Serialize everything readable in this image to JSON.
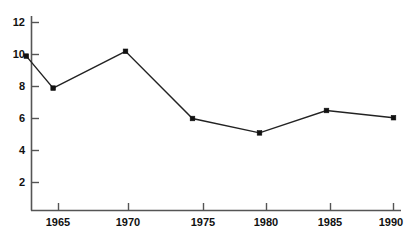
{
  "chart_data": {
    "type": "line",
    "title": "",
    "subtitle": "",
    "xlabel": "",
    "ylabel": "",
    "grid": false,
    "legend": false,
    "legend_position": "none",
    "xlim": [
      1962.5,
      1990.5
    ],
    "ylim": [
      0,
      12
    ],
    "xticks": [
      1965,
      1970,
      1975,
      1980,
      1985,
      1990
    ],
    "xtick_labels": [
      "1965",
      "1970",
      "1975",
      "1980",
      "1985",
      "1990"
    ],
    "yticks": [
      2,
      4,
      6,
      8,
      10,
      12
    ],
    "ytick_labels": [
      "2",
      "4",
      "6",
      "8",
      "10",
      "12"
    ],
    "x": [
      1962.6,
      1964.6,
      1970.0,
      1975.0,
      1980.0,
      1985.0,
      1990.0
    ],
    "values": [
      9.9,
      7.9,
      10.2,
      6.0,
      5.1,
      6.5,
      6.05
    ],
    "series": [
      {
        "name": "",
        "x": [
          1962.6,
          1964.6,
          1970.0,
          1975.0,
          1980.0,
          1985.0,
          1990.0
        ],
        "values": [
          9.9,
          7.9,
          10.2,
          6.0,
          5.1,
          6.5,
          6.05
        ],
        "color": "#222222",
        "marker": "square"
      }
    ],
    "colors": {
      "line": "#222222",
      "marker": "#111111",
      "axis": "#555555",
      "text": "#111111",
      "background": "#ffffff"
    }
  },
  "axes": {
    "y_tick_labels": [
      "12",
      "10",
      "8",
      "6",
      "4",
      "2"
    ],
    "x_tick_labels": [
      "1965",
      "1970",
      "1975",
      "1980",
      "1985",
      "1990"
    ]
  }
}
